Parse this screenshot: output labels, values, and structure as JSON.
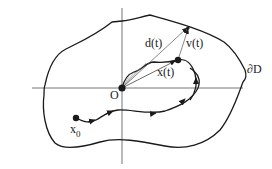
{
  "diagram": {
    "labels": {
      "origin": "O",
      "start": "x",
      "start_sub": "0",
      "position": "x(t)",
      "distance": "d(t)",
      "velocity": "v(t)",
      "boundary": "∂D"
    },
    "colors": {
      "ink": "#1a1a1a",
      "axis": "#555555",
      "background": "#ffffff"
    }
  }
}
